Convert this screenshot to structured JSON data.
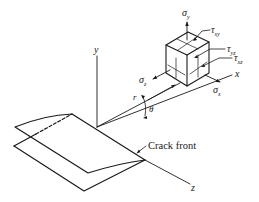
{
  "figure": {
    "axes": {
      "x_label": "x",
      "y_label": "y",
      "z_label": "z"
    },
    "polar": {
      "r_label": "r",
      "theta_label": "θ"
    },
    "stresses": {
      "sigma_y": "σ",
      "sigma_y_sub": "y",
      "sigma_x": "σ",
      "sigma_x_sub": "x",
      "sigma_z": "σ",
      "sigma_z_sub": "z",
      "tau_xy": "τ",
      "tau_xy_sub": "xy",
      "tau_yz": "τ",
      "tau_yz_sub": "yz",
      "tau_xz": "τ",
      "tau_xz_sub": "xz"
    },
    "annotations": {
      "crack_front": "Crack front"
    },
    "colors": {
      "ink": "#1a1a1a",
      "background": "#ffffff"
    }
  }
}
